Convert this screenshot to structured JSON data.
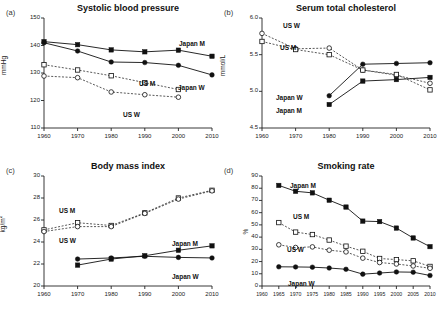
{
  "figure": {
    "panels": [
      "a",
      "b",
      "c",
      "d"
    ]
  },
  "chart_data": [
    {
      "type": "line",
      "panel_tag": "(a)",
      "title": "Systolic blood pressure",
      "xlabel": "",
      "ylabel": "mmHg",
      "ylim": [
        110,
        150
      ],
      "yticks": [
        110,
        120,
        130,
        140,
        150
      ],
      "xlim": [
        1960,
        2010
      ],
      "xticks": [
        1960,
        1970,
        1980,
        1990,
        2000,
        2010
      ],
      "grid": false,
      "legend_position": "inline-annotations",
      "series": [
        {
          "name": "Japan M",
          "marker": "filled-square",
          "line": "solid",
          "x": [
            1960,
            1970,
            1980,
            1990,
            2000,
            2010
          ],
          "values": [
            141.4,
            140.3,
            138.4,
            137.7,
            138.3,
            136.1
          ]
        },
        {
          "name": "Japan W",
          "marker": "filled-circle",
          "line": "solid",
          "x": [
            1960,
            1970,
            1980,
            1990,
            2000,
            2010
          ],
          "values": [
            141.0,
            138.0,
            134.0,
            133.8,
            132.8,
            129.3
          ]
        },
        {
          "name": "US M",
          "marker": "open-square",
          "line": "dashed",
          "x": [
            1960,
            1970,
            1980,
            1990,
            2000
          ],
          "values": [
            133.0,
            131.1,
            129.0,
            126.5,
            124.0
          ]
        },
        {
          "name": "US W",
          "marker": "open-circle",
          "line": "dashed",
          "x": [
            1960,
            1970,
            1980,
            1990,
            2000
          ],
          "values": [
            128.9,
            128.3,
            123.1,
            122.1,
            121.2
          ]
        }
      ]
    },
    {
      "type": "line",
      "panel_tag": "(b)",
      "title": "Serum total cholesterol",
      "xlabel": "",
      "ylabel": "mmol/L",
      "ylim": [
        4.5,
        6.0
      ],
      "yticks": [
        4.5,
        5.0,
        5.5,
        6.0
      ],
      "xlim": [
        1960,
        2010
      ],
      "xticks": [
        1960,
        1970,
        1980,
        1990,
        2000,
        2010
      ],
      "grid": false,
      "legend_position": "inline-annotations",
      "series": [
        {
          "name": "US W",
          "marker": "open-circle",
          "line": "dashed",
          "x": [
            1960,
            1970,
            1980,
            1990,
            2000,
            2010
          ],
          "values": [
            5.79,
            5.58,
            5.59,
            5.29,
            5.22,
            5.11
          ]
        },
        {
          "name": "US M",
          "marker": "open-square",
          "line": "dashed",
          "x": [
            1960,
            1970,
            1980,
            1990,
            2000,
            2010
          ],
          "values": [
            5.68,
            5.57,
            5.5,
            5.29,
            5.23,
            5.02
          ]
        },
        {
          "name": "Japan W",
          "marker": "filled-circle",
          "line": "solid",
          "x": [
            1980,
            1990,
            2000,
            2010
          ],
          "values": [
            4.94,
            5.37,
            5.38,
            5.39
          ]
        },
        {
          "name": "Japan M",
          "marker": "filled-square",
          "line": "solid",
          "x": [
            1980,
            1990,
            2000,
            2010
          ],
          "values": [
            4.82,
            5.14,
            5.16,
            5.19
          ]
        }
      ]
    },
    {
      "type": "line",
      "panel_tag": "(c)",
      "title": "Body mass index",
      "xlabel": "",
      "ylabel": "kg/m2",
      "ylim": [
        20,
        30
      ],
      "yticks": [
        20,
        22,
        24,
        26,
        28,
        30
      ],
      "xlim": [
        1960,
        2010
      ],
      "xticks": [
        1960,
        1970,
        1980,
        1990,
        2000,
        2010
      ],
      "grid": false,
      "legend_position": "inline-annotations",
      "series": [
        {
          "name": "US M",
          "marker": "open-square",
          "line": "dashed",
          "x": [
            1960,
            1970,
            1980,
            1990,
            2000,
            2010
          ],
          "values": [
            25.1,
            25.75,
            25.5,
            26.65,
            28.0,
            28.7
          ]
        },
        {
          "name": "US W",
          "marker": "open-circle",
          "line": "dashed",
          "x": [
            1960,
            1970,
            1980,
            1990,
            2000,
            2010
          ],
          "values": [
            24.95,
            25.4,
            25.4,
            26.6,
            27.9,
            28.65
          ]
        },
        {
          "name": "Japan M",
          "marker": "filled-square",
          "line": "solid",
          "x": [
            1970,
            1980,
            1990,
            2000,
            2010
          ],
          "values": [
            21.9,
            22.45,
            22.75,
            23.25,
            23.65
          ]
        },
        {
          "name": "Japan W",
          "marker": "filled-circle",
          "line": "solid",
          "x": [
            1970,
            1980,
            1990,
            2000,
            2010
          ],
          "values": [
            22.45,
            22.55,
            22.7,
            22.6,
            22.55
          ]
        }
      ]
    },
    {
      "type": "line",
      "panel_tag": "(d)",
      "title": "Smoking rate",
      "xlabel": "",
      "ylabel": "%",
      "ylim": [
        0,
        90
      ],
      "yticks": [
        0,
        10,
        20,
        30,
        40,
        50,
        60,
        70,
        80,
        90
      ],
      "xlim": [
        1960,
        2010
      ],
      "xticks": [
        1960,
        1965,
        1970,
        1975,
        1980,
        1985,
        1990,
        1995,
        2000,
        2005,
        2010
      ],
      "grid": false,
      "legend_position": "inline-annotations",
      "series": [
        {
          "name": "Japan M",
          "marker": "filled-square",
          "line": "solid",
          "x": [
            1965,
            1970,
            1975,
            1980,
            1985,
            1990,
            1995,
            2000,
            2005,
            2010
          ],
          "values": [
            82.3,
            77.5,
            76.2,
            70.2,
            64.6,
            53.1,
            52.7,
            47.4,
            39.3,
            32.2
          ]
        },
        {
          "name": "US M",
          "marker": "open-square",
          "line": "dashed",
          "x": [
            1965,
            1970,
            1975,
            1980,
            1985,
            1990,
            1995,
            2000,
            2005,
            2010
          ],
          "values": [
            51.9,
            44.1,
            42.1,
            37.6,
            32.6,
            28.4,
            22.5,
            21.6,
            20.6,
            16.0
          ]
        },
        {
          "name": "US W",
          "marker": "open-circle",
          "line": "dashed",
          "x": [
            1965,
            1970,
            1975,
            1980,
            1985,
            1990,
            1995,
            2000,
            2005,
            2010
          ],
          "values": [
            33.7,
            31.5,
            32.0,
            29.3,
            27.9,
            22.8,
            19.2,
            18.0,
            16.4,
            14.5
          ]
        },
        {
          "name": "Japan W",
          "marker": "filled-circle",
          "line": "solid",
          "x": [
            1965,
            1970,
            1975,
            1980,
            1985,
            1990,
            1995,
            2000,
            2005,
            2010
          ],
          "values": [
            15.7,
            15.6,
            15.4,
            14.7,
            13.7,
            9.7,
            10.6,
            11.5,
            11.3,
            8.6
          ]
        }
      ]
    }
  ]
}
